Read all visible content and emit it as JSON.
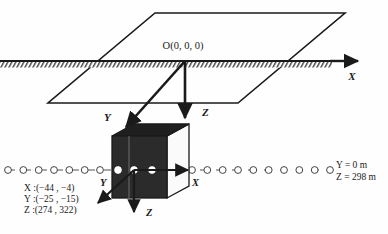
{
  "figure": {
    "title": "",
    "background_color": "#fefefe",
    "stroke_color": "#1a1a1a",
    "cube_fill_color": "#2b2b2b",
    "cube_side_fill_color": "#f2f2f2",
    "node_fill_color": "#ffffff"
  },
  "labels": {
    "origin": "O(0, 0, 0)",
    "global_x_axis": "X",
    "global_z_axis": "Z",
    "global_y_axis": "Y",
    "local_x_axis": "X",
    "local_y_axis": "Y",
    "local_z_axis": "Z",
    "line_value_y": "Y = 0 m",
    "line_value_z": "Z = 298 m",
    "range_x": "X :(−44 , −4)",
    "range_y": "Y :(−25 , −15)",
    "range_z": "Z :(274 , 322)"
  },
  "geometry": {
    "ground_line": {
      "x1": 0,
      "y1": 61,
      "x2": 340,
      "y2": 61
    },
    "x_axis_arrow_tip": {
      "x": 360,
      "y": 61
    },
    "plane_corners": [
      {
        "x": 155,
        "y": 13
      },
      {
        "x": 345,
        "y": 13
      },
      {
        "x": 238,
        "y": 103
      },
      {
        "x": 48,
        "y": 103
      }
    ],
    "origin_point": {
      "x": 185,
      "y": 61
    },
    "z_arrow_tip": {
      "x": 185,
      "y": 124
    },
    "y_arrow_tip": {
      "x": 122,
      "y": 131
    },
    "dotted_line": {
      "x1": 8,
      "y1": 170,
      "x2": 330,
      "y2": 170
    },
    "dotted_node_count": 22,
    "cube": {
      "front_x": 112,
      "front_y": 136,
      "front_w": 55,
      "front_h": 62,
      "depth_dx": 22,
      "depth_dy": -12
    },
    "local_origin": {
      "x": 134,
      "y": 170
    }
  },
  "nodes_on_cube": [
    {
      "x": 118,
      "y": 170
    },
    {
      "x": 134,
      "y": 170
    },
    {
      "x": 152,
      "y": 170
    }
  ],
  "chart_data": {
    "type": "diagram",
    "global_axes": [
      "X",
      "Y",
      "Z"
    ],
    "subvolume_bounds": {
      "X": [
        -44,
        -4
      ],
      "Y": [
        -25,
        -15
      ],
      "Z": [
        274,
        322
      ]
    },
    "node_line_attributes": {
      "Y": "0 m",
      "Z": "298 m"
    }
  }
}
